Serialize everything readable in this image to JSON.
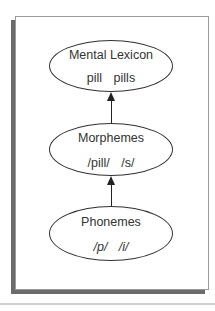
{
  "diagram": {
    "nodes": [
      {
        "id": "mental-lexicon",
        "title": "Mental Lexicon",
        "items": "pill   pills"
      },
      {
        "id": "morphemes",
        "title": "Morphemes",
        "items": "/pill/   /s/"
      },
      {
        "id": "phonemes",
        "title": "Phonemes",
        "items": "/p/   /i/"
      }
    ],
    "edges": [
      {
        "from": "phonemes",
        "to": "morphemes"
      },
      {
        "from": "morphemes",
        "to": "mental-lexicon"
      }
    ],
    "colors": {
      "stroke": "#333333",
      "shadow": "#6b6b6b",
      "frame": "#9a9a9a"
    }
  }
}
